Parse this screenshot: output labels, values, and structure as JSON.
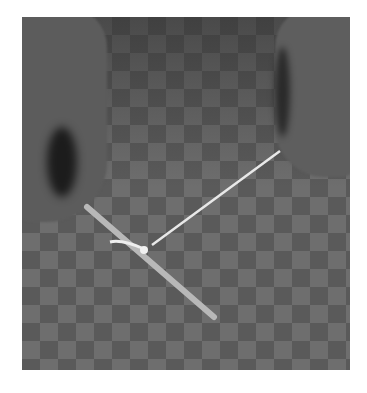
{
  "image": {
    "description": "Two hands holding a string tied with a knot to a thin stick on a checkered surface",
    "background": "#ffffff",
    "surface": "checkerboard",
    "objects": [
      "left-hand",
      "right-hand",
      "stick",
      "string",
      "knot"
    ]
  }
}
